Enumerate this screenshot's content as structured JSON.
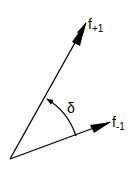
{
  "diagram": {
    "type": "vector-angle",
    "vectors": [
      {
        "id": "f_plus_1",
        "label_main": "f",
        "label_sub": "+1"
      },
      {
        "id": "f_minus_1",
        "label_main": "f",
        "label_sub": "-1"
      }
    ],
    "angle": {
      "label": "δ",
      "from": "f_minus_1",
      "to": "f_plus_1",
      "direction": "counter-clockwise"
    },
    "colors": {
      "stroke": "#000000",
      "background": "#ffffff"
    }
  }
}
